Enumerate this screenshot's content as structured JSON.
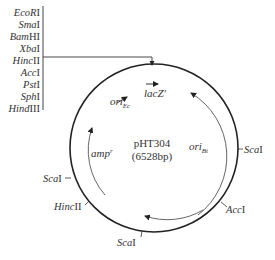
{
  "diagram": {
    "title": "pHT304",
    "size": "(6528bp)",
    "colors": {
      "backbone": "#222222",
      "inner": "#444444",
      "text": "#333333"
    },
    "mcs_sites": [
      {
        "name": "EcoR",
        "roman": "I"
      },
      {
        "name": "Sma",
        "roman": "I"
      },
      {
        "name": "Bam",
        "suffix": "H",
        "roman": "I"
      },
      {
        "name": "Xba",
        "roman": "I"
      },
      {
        "name": "Hinc",
        "roman": "II"
      },
      {
        "name": "Acc",
        "roman": "I"
      },
      {
        "name": "Pst",
        "roman": "I"
      },
      {
        "name": "Sph",
        "roman": "I"
      },
      {
        "name": "Hind",
        "roman": "III"
      }
    ],
    "features": {
      "ori_ec": {
        "base": "ori",
        "sub": "Ec"
      },
      "lacz": {
        "label": "lacZ′"
      },
      "ori_bt": {
        "base": "ori",
        "sub": "Bt"
      },
      "amp": {
        "base": "amp",
        "sup": "r"
      }
    },
    "sites": [
      {
        "name": "Sca",
        "roman": "I",
        "position": "right"
      },
      {
        "name": "Acc",
        "roman": "I",
        "position": "lower-right"
      },
      {
        "name": "Sca",
        "roman": "I",
        "position": "bottom"
      },
      {
        "name": "Hinc",
        "roman": "II",
        "position": "lower-left"
      },
      {
        "name": "Sca",
        "roman": "I",
        "position": "left"
      }
    ]
  }
}
